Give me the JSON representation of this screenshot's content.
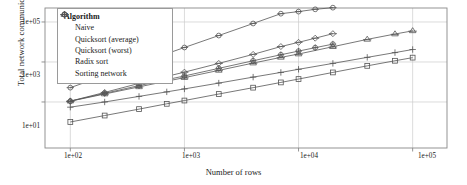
{
  "chart_data": {
    "type": "line",
    "title": "",
    "xlabel": "Number of rows",
    "ylabel": "Total network communication (MB)",
    "xscale": "log",
    "yscale": "log",
    "xlim": [
      60,
      200000
    ],
    "ylim": [
      0.05,
      500000
    ],
    "xticks": [
      "1e+02",
      "1e+03",
      "1e+04",
      "1e+05"
    ],
    "xtick_values": [
      100,
      1000,
      10000,
      100000
    ],
    "yticks": [
      "1e+01",
      "1e+03",
      "1e+05"
    ],
    "ytick_values": [
      10,
      1000,
      100000
    ],
    "grid": true,
    "legend": {
      "title": "Algorithm",
      "position": "top-left",
      "entries": [
        {
          "label": "Naive",
          "marker": "circle"
        },
        {
          "label": "Quicksort (average)",
          "marker": "circle-cross"
        },
        {
          "label": "Quicksort (worst)",
          "marker": "diamond"
        },
        {
          "label": "Radix sort",
          "marker": "plus"
        },
        {
          "label": "Sorting network",
          "marker": "triangle"
        }
      ]
    },
    "series": [
      {
        "name": "Naive",
        "marker": "circle",
        "x": [
          100,
          200,
          400,
          700,
          1000,
          2000,
          4000,
          7000,
          10000,
          14000,
          20000
        ],
        "y": [
          52,
          210,
          840,
          2600,
          5300,
          21000,
          84000,
          260000,
          330000,
          430000,
          520000
        ]
      },
      {
        "name": "Quicksort (average)",
        "marker": "circle-cross",
        "x": [
          100,
          200,
          400,
          700,
          1000,
          2000,
          4000,
          7000,
          10000,
          14000,
          20000
        ],
        "y": [
          11,
          27,
          66,
          130,
          200,
          480,
          1150,
          2300,
          3500,
          5200,
          7800
        ]
      },
      {
        "name": "Quicksort (worst)",
        "marker": "diamond",
        "x": [
          100,
          200,
          400,
          700,
          1000,
          2000,
          4000,
          7000,
          10000,
          14000,
          20000
        ],
        "y": [
          11,
          30,
          85,
          190,
          310,
          850,
          2400,
          5900,
          9600,
          15500,
          26000
        ]
      },
      {
        "name": "Radix sort",
        "marker": "plus",
        "x": [
          100,
          200,
          400,
          700,
          1000,
          2000,
          4000,
          7000,
          10000,
          20000,
          40000,
          70000,
          100000
        ],
        "y": [
          5.5,
          10,
          19,
          32,
          45,
          88,
          175,
          300,
          430,
          850,
          1700,
          2950,
          4200
        ]
      },
      {
        "name": "Sorting network",
        "marker": "triangle",
        "x": [
          100,
          200,
          400,
          700,
          1000,
          2000,
          4000,
          7000,
          10000,
          20000,
          40000,
          70000,
          100000
        ],
        "y": [
          11,
          25,
          57,
          110,
          165,
          380,
          880,
          1700,
          2500,
          5800,
          13500,
          25000,
          36000
        ]
      },
      {
        "name": "Sorting network lower",
        "marker": "square",
        "x": [
          100,
          200,
          400,
          700,
          1000,
          2000,
          4000,
          7000,
          10000,
          20000,
          40000,
          70000,
          100000
        ],
        "y": [
          1.0,
          2.1,
          4.4,
          8.1,
          11.8,
          25,
          52,
          95,
          140,
          300,
          640,
          1150,
          1650
        ]
      }
    ],
    "colors": {
      "line": "#555555",
      "marker": "#555555",
      "grid": "#cccccc",
      "frame": "#888888"
    }
  }
}
